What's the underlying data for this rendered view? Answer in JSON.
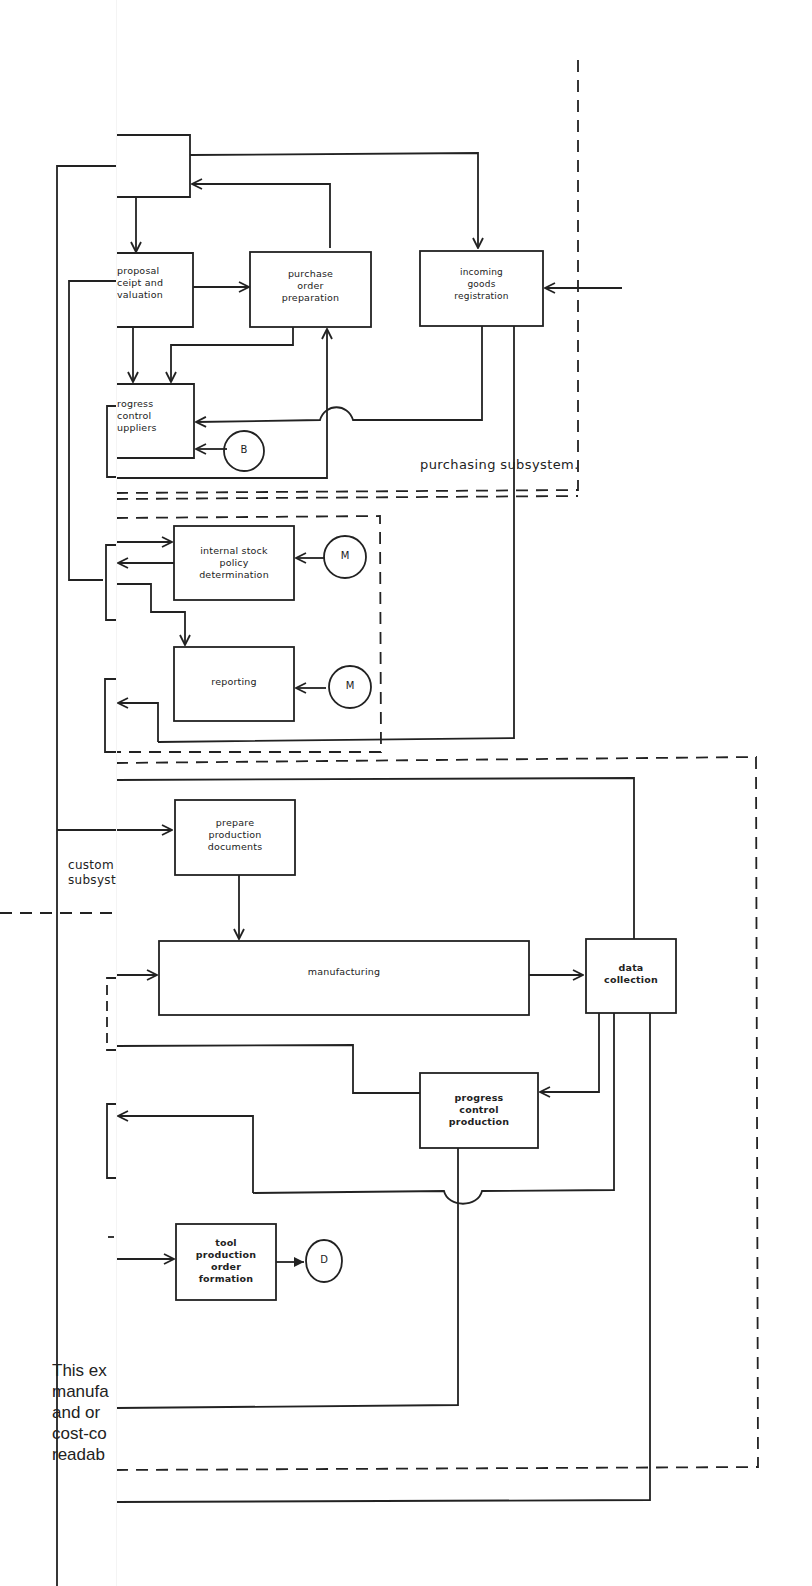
{
  "diagram": {
    "subsystems": {
      "purchasing": "purchasing subsystem.",
      "customer_partial": [
        "custom",
        "subsyst"
      ]
    },
    "boxes": {
      "top_unlabeled": "",
      "proposal": [
        "proposal",
        "receipt and",
        "evaluation"
      ],
      "proposal_visible": [
        "proposal",
        "ceipt and",
        "valuation"
      ],
      "purchase_order": [
        "purchase",
        "order",
        "preparation"
      ],
      "incoming_goods": [
        "incoming",
        "goods",
        "registration"
      ],
      "progress_suppliers": [
        "progress",
        "control",
        "suppliers"
      ],
      "progress_suppliers_visible": [
        "rogress",
        "control",
        "uppliers"
      ],
      "internal_stock": [
        "internal stock",
        "policy",
        "determination"
      ],
      "reporting": "reporting",
      "prepare_docs": [
        "prepare",
        "production",
        "documents"
      ],
      "manufacturing": "manufacturing",
      "data_collection": [
        "data",
        "collection"
      ],
      "progress_production": [
        "progress",
        "control",
        "production"
      ],
      "tool_production": [
        "tool",
        "production",
        "order",
        "formation"
      ]
    },
    "connectors": {
      "B": "B",
      "M1": "M",
      "M2": "M",
      "D": "D"
    },
    "paragraph_fragment": [
      "This ex",
      "manufa",
      "and or",
      "cost-co",
      "readab"
    ]
  }
}
